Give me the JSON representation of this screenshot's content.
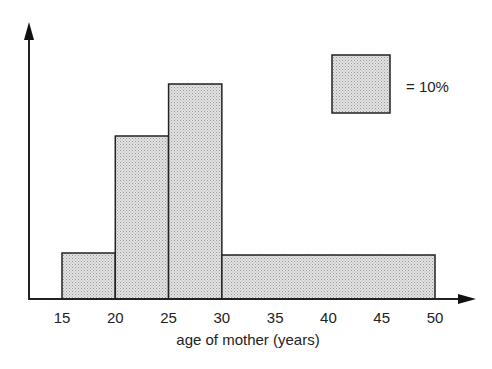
{
  "chart_data": {
    "type": "bar",
    "subtype": "histogram",
    "title": "",
    "xlabel": "age of mother (years)",
    "ylabel": "",
    "x_ticks": [
      15,
      20,
      25,
      30,
      35,
      40,
      45,
      50
    ],
    "bins": [
      {
        "from": 15,
        "to": 20,
        "percent": 7.5,
        "height_px": 46
      },
      {
        "from": 20,
        "to": 25,
        "percent": 25,
        "height_px": 163
      },
      {
        "from": 25,
        "to": 30,
        "percent": 35,
        "height_px": 215
      },
      {
        "from": 30,
        "to": 50,
        "percent": 28,
        "height_px": 44
      }
    ],
    "categories": [
      "15-20",
      "20-25",
      "25-30",
      "30-50"
    ],
    "values": [
      7.5,
      25,
      35,
      28
    ],
    "legend": {
      "symbol": "square",
      "label": "= 10%",
      "meaning": "area of square represents 10% of births"
    },
    "grid": false,
    "fill_color": "#d9d9d9",
    "stroke_color": "#222222"
  }
}
